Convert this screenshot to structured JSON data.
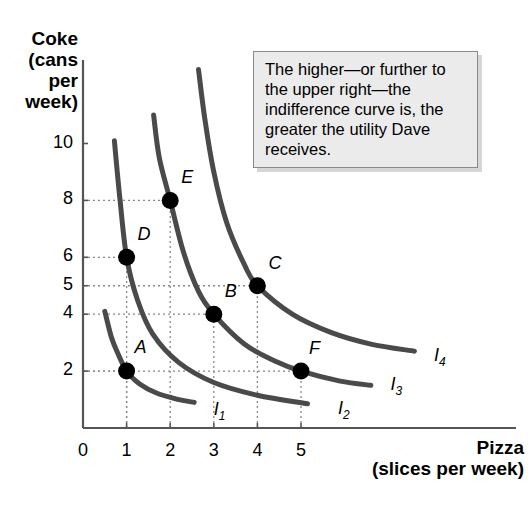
{
  "chart_data": {
    "type": "line",
    "title": "",
    "xlabel": "Pizza (slices per week)",
    "ylabel": "Coke (cans per week)",
    "xlabel_main": "Pizza",
    "xlabel_sub": "(slices per week)",
    "ylabel_lines": [
      "Coke",
      "(cans",
      "per",
      "week)"
    ],
    "xlim": [
      0,
      6.2
    ],
    "ylim": [
      0,
      11.5
    ],
    "xticks": [
      0,
      1,
      2,
      3,
      4,
      5
    ],
    "yticks": [
      2,
      4,
      5,
      6,
      8,
      10
    ],
    "grid": "dotted-guides-to-points",
    "legend": "inline-curve-labels",
    "series": [
      {
        "name": "I1",
        "label": "I",
        "sub": "1",
        "label_x": 3.0,
        "label_y": 0.55,
        "points": [
          {
            "x": 0.5,
            "y": 4.1
          },
          {
            "x": 0.65,
            "y": 3.2
          },
          {
            "x": 0.8,
            "y": 2.62
          },
          {
            "x": 1.0,
            "y": 2.0
          },
          {
            "x": 1.3,
            "y": 1.55
          },
          {
            "x": 1.7,
            "y": 1.22
          },
          {
            "x": 2.2,
            "y": 1.0
          },
          {
            "x": 2.55,
            "y": 0.9
          }
        ]
      },
      {
        "name": "I2",
        "label": "I",
        "sub": "2",
        "label_x": 5.85,
        "label_y": 0.6,
        "points": [
          {
            "x": 0.72,
            "y": 10.1
          },
          {
            "x": 0.85,
            "y": 8.0
          },
          {
            "x": 1.0,
            "y": 6.0
          },
          {
            "x": 1.25,
            "y": 4.5
          },
          {
            "x": 1.6,
            "y": 3.3
          },
          {
            "x": 2.2,
            "y": 2.3
          },
          {
            "x": 3.0,
            "y": 1.6
          },
          {
            "x": 4.0,
            "y": 1.15
          },
          {
            "x": 5.15,
            "y": 0.85
          }
        ]
      },
      {
        "name": "I3",
        "label": "I",
        "sub": "3",
        "label_x": 7.05,
        "label_y": 1.45,
        "points": [
          {
            "x": 1.62,
            "y": 11.0
          },
          {
            "x": 1.75,
            "y": 9.5
          },
          {
            "x": 2.0,
            "y": 8.0
          },
          {
            "x": 2.3,
            "y": 6.2
          },
          {
            "x": 2.65,
            "y": 4.8
          },
          {
            "x": 3.0,
            "y": 4.0
          },
          {
            "x": 3.7,
            "y": 2.95
          },
          {
            "x": 4.4,
            "y": 2.35
          },
          {
            "x": 5.0,
            "y": 2.0
          },
          {
            "x": 5.9,
            "y": 1.65
          },
          {
            "x": 6.6,
            "y": 1.5
          }
        ]
      },
      {
        "name": "I4",
        "label": "I",
        "sub": "4",
        "label_x": 8.05,
        "label_y": 2.45,
        "points": [
          {
            "x": 2.65,
            "y": 12.6
          },
          {
            "x": 2.8,
            "y": 10.8
          },
          {
            "x": 3.0,
            "y": 9.0
          },
          {
            "x": 3.3,
            "y": 7.2
          },
          {
            "x": 3.7,
            "y": 5.75
          },
          {
            "x": 4.0,
            "y": 5.0
          },
          {
            "x": 4.8,
            "y": 4.0
          },
          {
            "x": 5.7,
            "y": 3.35
          },
          {
            "x": 6.6,
            "y": 2.95
          },
          {
            "x": 7.6,
            "y": 2.7
          }
        ]
      }
    ],
    "points": [
      {
        "label": "A",
        "x": 1,
        "y": 2,
        "curve": "I1",
        "label_dx": 8,
        "label_dy": -34
      },
      {
        "label": "B",
        "x": 3,
        "y": 4,
        "curve": "I3",
        "label_dx": 11,
        "label_dy": -33
      },
      {
        "label": "C",
        "x": 4,
        "y": 5,
        "curve": "I4",
        "label_dx": 11,
        "label_dy": -33
      },
      {
        "label": "D",
        "x": 1,
        "y": 6,
        "curve": "I2",
        "label_dx": 11,
        "label_dy": -33
      },
      {
        "label": "E",
        "x": 2,
        "y": 8,
        "curve": "I3",
        "label_dx": 11,
        "label_dy": -33
      },
      {
        "label": "F",
        "x": 5,
        "y": 2,
        "curve": "I3",
        "label_dx": 8,
        "label_dy": -33
      }
    ],
    "annotations": [
      {
        "id": "callout",
        "text": "The higher—or further to the upper right—the indifference curve is, the greater the utility Dave receives."
      }
    ]
  },
  "colors": {
    "curve": "#4a4a4a",
    "axis": "#555555",
    "point": "#000000",
    "guide": "#888888",
    "callout_bg": "#ebebeb",
    "callout_border": "#8a8a8a",
    "text": "#000000"
  }
}
